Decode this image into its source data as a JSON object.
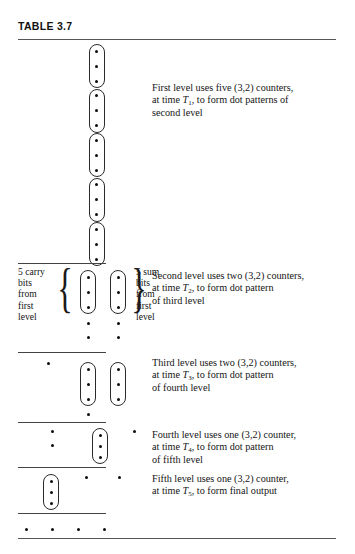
{
  "table": {
    "title": "TABLE 3.7"
  },
  "levels": [
    {
      "id": "first-level",
      "description_lines": [
        "First level uses five (3,2) counters,",
        "at time T₁, to form dot patterns of",
        "second level"
      ],
      "text_plain": "First level uses five (3,2) counters, at time T1, to form dot patterns of second level",
      "counters": 5,
      "counter_type": "(3,2)",
      "time_label": "T",
      "time_index": "1"
    },
    {
      "id": "second-level",
      "description_lines": [
        "Second level uses two (3,2) counters,",
        "at time T₂, to form dot pattern",
        "of third level"
      ],
      "text_plain": "Second level uses two (3,2) counters, at time T2, to form dot pattern of third level",
      "counters": 2,
      "counter_type": "(3,2)",
      "time_label": "T",
      "time_index": "2",
      "left_label_lines": [
        "5 carry",
        "bits",
        "from",
        "first",
        "level"
      ],
      "right_label_lines": [
        "5 sum",
        "bits",
        "from",
        "first",
        "level"
      ]
    },
    {
      "id": "third-level",
      "description_lines": [
        "Third level uses two (3,2) counters,",
        "at time T₃, to form dot pattern",
        "of fourth level"
      ],
      "text_plain": "Third level uses two (3,2) counters, at time T3, to form dot pattern of fourth level",
      "counters": 2,
      "counter_type": "(3,2)",
      "time_label": "T",
      "time_index": "3"
    },
    {
      "id": "fourth-level",
      "description_lines": [
        "Fourth level uses one (3,2) counter,",
        "at time T₄, to form dot pattern",
        "of fifth level"
      ],
      "text_plain": "Fourth level uses one (3,2) counter, at time T4, to form dot pattern of fifth level",
      "counters": 1,
      "counter_type": "(3,2)",
      "time_label": "T",
      "time_index": "4"
    },
    {
      "id": "fifth-level",
      "description_lines": [
        "Fifth level uses one (3,2) counter,",
        "at time T₅, to form final output"
      ],
      "text_plain": "Fifth level uses one (3,2) counter, at time T5, to form final output",
      "counters": 1,
      "counter_type": "(3,2)",
      "time_label": "T",
      "time_index": "5"
    }
  ],
  "diagram": {
    "dot_color": "#0d0d0d",
    "capsule_border_color": "#2a2a2a",
    "rule_color": "#555555",
    "first_level_capsules": 5,
    "first_level_dots_per_capsule": 3,
    "second_level_capsules": 2,
    "second_level_loose_dot_rows": 2,
    "third_level_capsules": 2,
    "fourth_level_capsules": 1,
    "fifth_level_capsules": 1,
    "final_output_dots": 4
  }
}
